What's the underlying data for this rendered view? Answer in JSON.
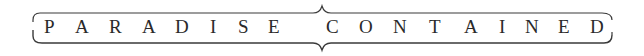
{
  "banner": {
    "title": "PARADISE CONTAINED",
    "words": [
      "PARADISE",
      "CONTAINED"
    ],
    "letters": [
      {
        "ch": "P",
        "x": 44
      },
      {
        "ch": "A",
        "x": 75
      },
      {
        "ch": "R",
        "x": 109
      },
      {
        "ch": "A",
        "x": 142
      },
      {
        "ch": "D",
        "x": 175
      },
      {
        "ch": "I",
        "x": 210
      },
      {
        "ch": "S",
        "x": 238
      },
      {
        "ch": "E",
        "x": 268
      },
      {
        "ch": "C",
        "x": 326
      },
      {
        "ch": "O",
        "x": 359
      },
      {
        "ch": "N",
        "x": 393
      },
      {
        "ch": "T",
        "x": 429
      },
      {
        "ch": "A",
        "x": 464
      },
      {
        "ch": "I",
        "x": 499
      },
      {
        "ch": "N",
        "x": 525
      },
      {
        "ch": "E",
        "x": 558
      },
      {
        "ch": "D",
        "x": 590
      }
    ],
    "colors": {
      "text": "#2a2a2a",
      "frame": "#3a3a3a",
      "background": "#ffffff"
    }
  }
}
